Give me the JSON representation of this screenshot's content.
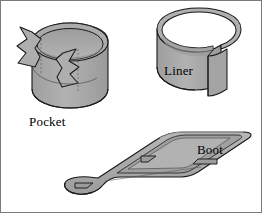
{
  "figure": {
    "type": "technical-line-illustration",
    "background_color": "#ffffff",
    "frame_border_color": "#7a7a7a",
    "shape_fill_color": "#a8a8a8",
    "shape_fill_light": "#b8b8b8",
    "shape_fill_dark": "#9a9a9a",
    "outline_color": "#1a1a1a",
    "hidden_line_color": "#555555",
    "parts": [
      {
        "id": "pocket",
        "label": "Pocket",
        "description": "open cylindrical pocket with zigzag interlocking notches on left and right walls",
        "label_x": 28,
        "label_y": 113
      },
      {
        "id": "liner",
        "label": "Liner",
        "description": "C-shaped open cylindrical band with vertical seam gap",
        "label_x": 163,
        "label_y": 62
      },
      {
        "id": "boot",
        "label": "Boot",
        "description": "elongated flat trough channel with rounded end and side tabs",
        "label_x": 196,
        "label_y": 141
      }
    ]
  }
}
